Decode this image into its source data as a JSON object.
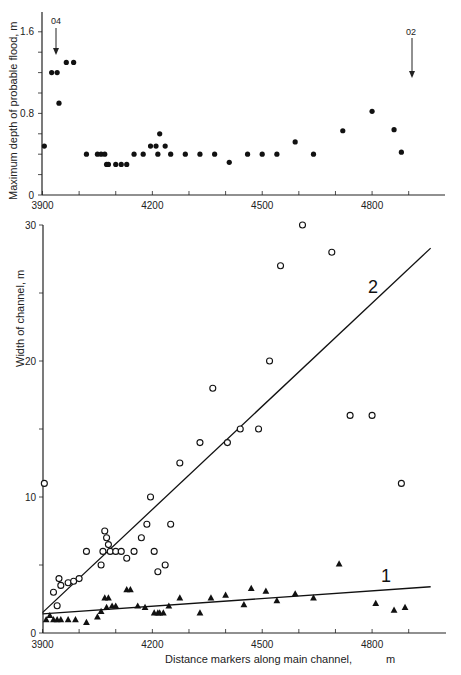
{
  "chart_data": [
    {
      "type": "scatter",
      "title": "",
      "xlabel": "",
      "ylabel": "Maximum depth of probable flood,   m",
      "xlim": [
        3900,
        4960
      ],
      "ylim": [
        0,
        1.7
      ],
      "x_ticks": [
        3900,
        4200,
        4500,
        4800
      ],
      "y_ticks": [
        0,
        0.8,
        1.6
      ],
      "y_tick_labels": [
        "0",
        "0.8",
        "1.6"
      ],
      "x_tick_labels": [
        "3900",
        "4200",
        "4500",
        "4800"
      ],
      "grid": false,
      "annotations": [
        {
          "text": "04",
          "x": 3935,
          "arrow_to_y": 1.37
        },
        {
          "text": "02",
          "x": 4905,
          "arrow_to_y": 0.92
        }
      ],
      "series": [
        {
          "name": "Maximum depth of probable flood",
          "marker": "filled-circle",
          "x": [
            3905,
            3925,
            3940,
            3945,
            3965,
            3985,
            4020,
            4050,
            4060,
            4070,
            4075,
            4080,
            4100,
            4115,
            4130,
            4150,
            4175,
            4195,
            4210,
            4215,
            4220,
            4235,
            4250,
            4290,
            4330,
            4370,
            4410,
            4460,
            4500,
            4540,
            4590,
            4640,
            4720,
            4800,
            4860,
            4880
          ],
          "y": [
            0.48,
            1.2,
            1.2,
            0.9,
            1.3,
            1.3,
            0.4,
            0.4,
            0.4,
            0.4,
            0.3,
            0.3,
            0.3,
            0.3,
            0.3,
            0.4,
            0.4,
            0.48,
            0.48,
            0.4,
            0.6,
            0.48,
            0.4,
            0.4,
            0.4,
            0.4,
            0.32,
            0.4,
            0.4,
            0.4,
            0.52,
            0.4,
            0.63,
            0.82,
            0.64,
            0.42
          ]
        }
      ]
    },
    {
      "type": "scatter",
      "title": "",
      "xlabel": "Distance   markers along main channel,          m",
      "ylabel": "Width  of  channel, m",
      "xlim": [
        3900,
        4960
      ],
      "ylim": [
        0,
        30
      ],
      "x_ticks": [
        3900,
        4200,
        4500,
        4800
      ],
      "x_tick_labels": [
        "3900",
        "4200",
        "4500",
        "4800"
      ],
      "y_ticks": [
        0,
        10,
        20,
        30
      ],
      "y_tick_labels": [
        "0",
        "10",
        "20",
        "30"
      ],
      "grid": false,
      "legend": "inline line labels",
      "series": [
        {
          "name": "2",
          "marker": "open-circle",
          "x": [
            3905,
            3930,
            3940,
            3945,
            3950,
            3970,
            3985,
            4000,
            4020,
            4060,
            4065,
            4070,
            4075,
            4080,
            4085,
            4100,
            4115,
            4130,
            4150,
            4170,
            4185,
            4195,
            4205,
            4215,
            4235,
            4250,
            4275,
            4330,
            4365,
            4405,
            4440,
            4490,
            4520,
            4550,
            4610,
            4690,
            4740,
            4800,
            4880
          ],
          "y": [
            11,
            3,
            2,
            4,
            3.5,
            3.7,
            3.8,
            4,
            6,
            5,
            6,
            7.5,
            7,
            6.5,
            6,
            6,
            6,
            5.5,
            6,
            7,
            8,
            10,
            6,
            4.5,
            5,
            8,
            12.5,
            14,
            18,
            14,
            15,
            15,
            20,
            27,
            30,
            28,
            16,
            16,
            11
          ],
          "fit_line": {
            "x": [
              3900,
              4960
            ],
            "y": [
              1.5,
              28.3
            ]
          }
        },
        {
          "name": "1",
          "marker": "filled-triangle",
          "x": [
            3910,
            3920,
            3930,
            3940,
            3950,
            3970,
            3990,
            4020,
            4050,
            4060,
            4070,
            4075,
            4080,
            4090,
            4100,
            4130,
            4140,
            4160,
            4180,
            4205,
            4215,
            4220,
            4230,
            4245,
            4275,
            4330,
            4360,
            4400,
            4450,
            4470,
            4510,
            4540,
            4590,
            4640,
            4710,
            4810,
            4860,
            4890
          ],
          "y": [
            1,
            1.3,
            1,
            1,
            1,
            1,
            1,
            0.8,
            1.2,
            1.6,
            2.6,
            1.9,
            2.6,
            2,
            2,
            3.2,
            3.2,
            2,
            1.9,
            1.5,
            1.5,
            1.5,
            1.5,
            2,
            2.6,
            1.5,
            2.6,
            2.8,
            2.1,
            3.3,
            3.1,
            2.4,
            2.9,
            2.6,
            5.1,
            2.2,
            1.7,
            1.9
          ],
          "fit_line": {
            "x": [
              3900,
              4960
            ],
            "y": [
              1.4,
              3.4
            ]
          }
        }
      ],
      "line_labels": [
        {
          "text": "2",
          "x": 4700,
          "y": 22.2
        },
        {
          "text": "1",
          "x": 4850,
          "y": 4.5
        }
      ]
    }
  ],
  "top": {
    "ylabel": "Maximum depth of probable flood,   m",
    "y_ticks": [
      "0",
      "0.8",
      "1.6"
    ],
    "x_ticks": [
      "3900",
      "4200",
      "4500",
      "4800"
    ],
    "marker_04": "04",
    "marker_02": "02"
  },
  "bottom": {
    "ylabel": "Width  of  channel, m",
    "xlabel": "Distance   markers along main channel,",
    "xlabel_unit": "m",
    "y_ticks": [
      "0",
      "10",
      "20",
      "30"
    ],
    "x_ticks": [
      "3900",
      "4200",
      "4500",
      "4800"
    ],
    "line2_label": "2",
    "line1_label": "1"
  }
}
